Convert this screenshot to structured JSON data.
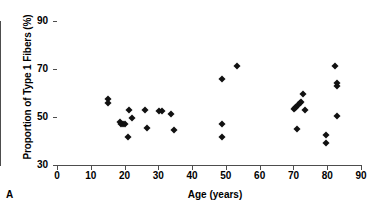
{
  "figure": {
    "panel_letter": "A",
    "marker_color": "#111111",
    "axis_color": "#4d4d4d"
  },
  "chart_data": {
    "type": "scatter",
    "title": "",
    "xlabel": "Age (years)",
    "ylabel": "Proportion of Type 1 Fibers (%)",
    "xlim": [
      0,
      90
    ],
    "ylim": [
      30,
      90
    ],
    "xticks": [
      0,
      10,
      20,
      30,
      40,
      50,
      60,
      70,
      80,
      90
    ],
    "yticks": [
      30,
      50,
      70,
      90
    ],
    "grid": false,
    "legend": null,
    "marker": "diamond",
    "series": [
      {
        "name": "Subjects",
        "points": [
          {
            "x": 15.0,
            "y": 57.5
          },
          {
            "x": 15.0,
            "y": 55.8
          },
          {
            "x": 18.6,
            "y": 48.0
          },
          {
            "x": 19.0,
            "y": 47.0
          },
          {
            "x": 19.6,
            "y": 47.2
          },
          {
            "x": 20.0,
            "y": 46.9
          },
          {
            "x": 21.0,
            "y": 41.6
          },
          {
            "x": 21.3,
            "y": 52.8
          },
          {
            "x": 22.3,
            "y": 49.5
          },
          {
            "x": 26.0,
            "y": 52.8
          },
          {
            "x": 26.7,
            "y": 45.5
          },
          {
            "x": 30.3,
            "y": 52.3
          },
          {
            "x": 31.0,
            "y": 52.5
          },
          {
            "x": 33.7,
            "y": 51.2
          },
          {
            "x": 34.7,
            "y": 44.6
          },
          {
            "x": 48.8,
            "y": 65.8
          },
          {
            "x": 48.8,
            "y": 47.0
          },
          {
            "x": 48.8,
            "y": 41.6
          },
          {
            "x": 53.3,
            "y": 71.4
          },
          {
            "x": 70.1,
            "y": 53.3
          },
          {
            "x": 70.4,
            "y": 53.6
          },
          {
            "x": 70.8,
            "y": 54.3
          },
          {
            "x": 71.1,
            "y": 45.2
          },
          {
            "x": 71.4,
            "y": 55.0
          },
          {
            "x": 71.8,
            "y": 56.0
          },
          {
            "x": 72.1,
            "y": 56.3
          },
          {
            "x": 72.8,
            "y": 59.5
          },
          {
            "x": 73.4,
            "y": 53.0
          },
          {
            "x": 79.6,
            "y": 42.7
          },
          {
            "x": 79.6,
            "y": 39.2
          },
          {
            "x": 82.2,
            "y": 71.2
          },
          {
            "x": 83.0,
            "y": 64.3
          },
          {
            "x": 83.0,
            "y": 63.0
          },
          {
            "x": 83.0,
            "y": 50.3
          }
        ]
      }
    ]
  }
}
